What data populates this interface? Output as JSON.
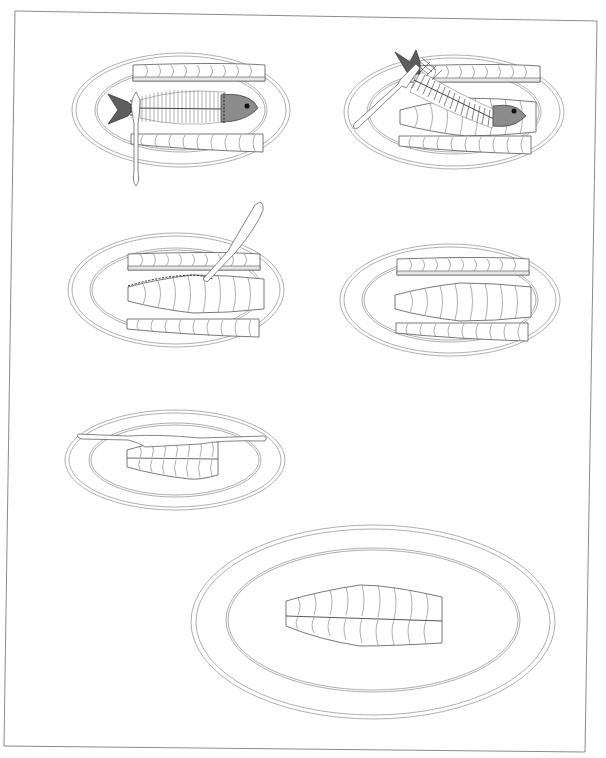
{
  "figure": {
    "background": "#ffffff",
    "line_color": "#9a9a9a",
    "frame": {
      "points": [
        [
          15,
          11
        ],
        [
          597,
          21
        ],
        [
          585,
          752
        ],
        [
          4,
          746
        ]
      ]
    }
  },
  "steps": [
    {
      "step": 1,
      "name": "cut-along-spine",
      "plate": {
        "cx": 181,
        "cy": 110,
        "rx": 109,
        "ry": 57
      },
      "elements": [
        "fish-skeleton",
        "knife-vertical",
        "top-fillet",
        "bottom-fillet",
        "head",
        "tail"
      ]
    },
    {
      "step": 2,
      "name": "lift-skeleton-with-fork",
      "plate": {
        "cx": 454,
        "cy": 112,
        "rx": 110,
        "ry": 57
      },
      "elements": [
        "fish-skeleton",
        "fork",
        "top-fillet",
        "middle-fillet",
        "bottom-fillet",
        "head",
        "tail"
      ]
    },
    {
      "step": 3,
      "name": "trim-fillet-edge",
      "plate": {
        "cx": 176,
        "cy": 290,
        "rx": 108,
        "ry": 57
      },
      "elements": [
        "knife-diagonal",
        "dashed-cut-line",
        "top-fillet",
        "middle-fillet",
        "bottom-fillet"
      ]
    },
    {
      "step": 4,
      "name": "fillets-arranged",
      "plate": {
        "cx": 450,
        "cy": 300,
        "rx": 110,
        "ry": 56
      },
      "elements": [
        "top-fillet",
        "middle-fillet",
        "bottom-fillet"
      ]
    },
    {
      "step": 5,
      "name": "reassemble-fillet-with-knife",
      "plate": {
        "cx": 175,
        "cy": 460,
        "rx": 110,
        "ry": 50
      },
      "elements": [
        "knife-horizontal",
        "joined-fillet"
      ]
    },
    {
      "step": 6,
      "name": "served-fillet",
      "plate": {
        "cx": 373,
        "cy": 622,
        "rx": 182,
        "ry": 97
      },
      "elements": [
        "joined-fillet"
      ]
    }
  ]
}
